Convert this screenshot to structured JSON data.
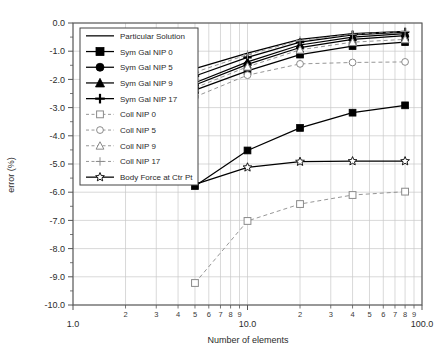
{
  "chart_data": {
    "type": "line",
    "title": "",
    "xlabel": "Number of elements",
    "ylabel": "error (%)",
    "xscale": "log",
    "yscale": "linear",
    "xlim": [
      1.0,
      100.0
    ],
    "ylim": [
      -10.0,
      0.0
    ],
    "grid": true,
    "legend_position": "upper-left-inside",
    "x_major_ticks": [
      "1.0",
      "10.0",
      "100.0"
    ],
    "x_major_values": [
      1,
      10,
      100
    ],
    "x_minor_ticks": [
      "2",
      "3",
      "4",
      "5",
      "6",
      "7",
      "8",
      "9",
      "2",
      "3",
      "4",
      "5",
      "6",
      "7",
      "8",
      "9"
    ],
    "x_minor_values": [
      2,
      3,
      4,
      5,
      6,
      7,
      8,
      9,
      20,
      30,
      40,
      50,
      60,
      70,
      80,
      90
    ],
    "y_ticks": [
      "0.0",
      "-1.0",
      "-2.0",
      "-3.0",
      "-4.0",
      "-5.0",
      "-6.0",
      "-7.0",
      "-8.0",
      "-9.0",
      "-10.0"
    ],
    "y_values": [
      0,
      -1,
      -2,
      -3,
      -4,
      -5,
      -6,
      -7,
      -8,
      -9,
      -10
    ],
    "series": [
      {
        "name": "Particular Solution",
        "marker": "none",
        "linestyle": "solid",
        "color": "#000000",
        "x": [
          5,
          10,
          20,
          40,
          80
        ],
        "y": [
          -1.62,
          -1.07,
          -0.58,
          -0.38,
          -0.3
        ]
      },
      {
        "name": "Sym Gal NIP 0",
        "marker": "filled-square",
        "linestyle": "solid",
        "color": "#000000",
        "x": [
          5,
          10,
          20,
          40,
          80
        ],
        "y": [
          -2.38,
          -1.7,
          -1.12,
          -0.82,
          -0.68
        ]
      },
      {
        "name": "Sym Gal NIP 5",
        "marker": "filled-circle",
        "linestyle": "solid",
        "color": "#000000",
        "x": [
          5,
          10,
          20,
          40,
          80
        ],
        "y": [
          -2.2,
          -1.47,
          -0.87,
          -0.58,
          -0.45
        ]
      },
      {
        "name": "Sym Gal NIP 9",
        "marker": "filled-triangle",
        "linestyle": "solid",
        "color": "#000000",
        "x": [
          5,
          10,
          20,
          40,
          80
        ],
        "y": [
          -2.12,
          -1.38,
          -0.78,
          -0.5,
          -0.38
        ]
      },
      {
        "name": "Sym Gal NIP 17",
        "marker": "filled-plus",
        "linestyle": "solid",
        "color": "#000000",
        "x": [
          5,
          10,
          20,
          40,
          80
        ],
        "y": [
          -1.88,
          -1.22,
          -0.68,
          -0.42,
          -0.32
        ]
      },
      {
        "name": "Coll NIP 0",
        "marker": "open-square",
        "linestyle": "dashed",
        "color": "#8a8a8a",
        "x": [
          5,
          10,
          20,
          40,
          80
        ],
        "y": [
          -9.22,
          -7.02,
          -6.42,
          -6.1,
          -5.98
        ]
      },
      {
        "name": "Coll NIP 5",
        "marker": "open-circle",
        "linestyle": "dashed",
        "color": "#8a8a8a",
        "x": [
          5,
          10,
          20,
          40,
          80
        ],
        "y": [
          -2.62,
          -1.85,
          -1.45,
          -1.4,
          -1.38
        ]
      },
      {
        "name": "Coll NIP 9",
        "marker": "open-triangle",
        "linestyle": "dashed",
        "color": "#8a8a8a",
        "x": [
          5,
          10,
          20,
          40,
          80
        ],
        "y": [
          -2.3,
          -1.55,
          -0.95,
          -0.68,
          -0.58
        ]
      },
      {
        "name": "Coll NIP 17",
        "marker": "open-plus",
        "linestyle": "dashed",
        "color": "#8a8a8a",
        "x": [
          5,
          10,
          20,
          40,
          80
        ],
        "y": [
          -1.75,
          -1.12,
          -0.62,
          -0.4,
          -0.3
        ]
      },
      {
        "name": "Body Force at Ctr Pt",
        "marker": "open-star",
        "linestyle": "solid",
        "color": "#000000",
        "x": [
          5,
          10,
          20,
          40,
          80
        ],
        "y": [
          -5.72,
          -5.12,
          -4.92,
          -4.9,
          -4.9
        ]
      }
    ],
    "extra_series": [
      {
        "name": "Sym Gal NIP 0 lower branch",
        "marker": "filled-square",
        "linestyle": "solid",
        "color": "#000000",
        "x": [
          5,
          10,
          20,
          40,
          80
        ],
        "y": [
          -5.78,
          -4.52,
          -3.72,
          -3.18,
          -2.92
        ]
      }
    ]
  },
  "legend": {
    "entries": [
      {
        "label": "Particular Solution"
      },
      {
        "label": "Sym Gal NIP 0"
      },
      {
        "label": "Sym Gal NIP 5"
      },
      {
        "label": "Sym Gal NIP 9"
      },
      {
        "label": "Sym Gal NIP 17"
      },
      {
        "label": "Coll NIP 0"
      },
      {
        "label": "Coll NIP 5"
      },
      {
        "label": "Coll NIP 9"
      },
      {
        "label": "Coll NIP 17"
      },
      {
        "label": "Body Force at Ctr Pt"
      }
    ]
  },
  "axes": {
    "x_title": "Number of elements",
    "y_title": "error (%)"
  },
  "colors": {
    "frame": "#555555",
    "grid": "#c9c9c9",
    "solid_series": "#000000",
    "dashed_series": "#8a8a8a",
    "text": "#2b2b2b"
  }
}
